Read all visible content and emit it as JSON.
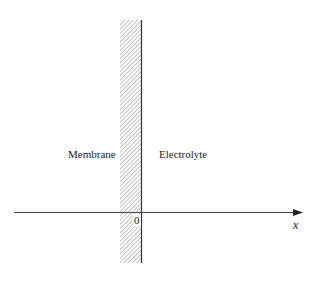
{
  "figure": {
    "regions": {
      "left_label": "Membrane",
      "right_label": "Electrolyte"
    },
    "axis": {
      "origin_label": "0",
      "axis_label": "x"
    },
    "membrane_band": {
      "x_left": 120,
      "x_right": 141,
      "y_top": 20,
      "y_bottom": 263,
      "fill_pattern": "diagonal-hatch"
    },
    "colors": {
      "line": "#333333",
      "hatch": "#777777",
      "background": "#ffffff"
    }
  }
}
